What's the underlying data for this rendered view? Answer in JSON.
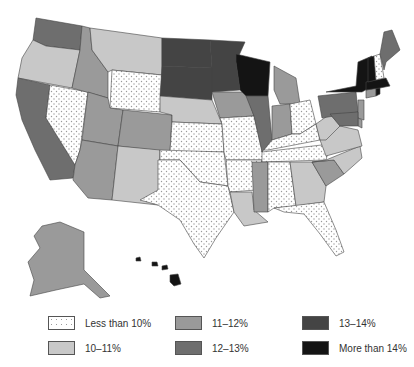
{
  "legend": {
    "items": [
      {
        "key": "lt10",
        "label": "Less than 10%",
        "fill": "dots"
      },
      {
        "key": "10_11",
        "label": "10–11%",
        "fill": "#c8c8c8"
      },
      {
        "key": "11_12",
        "label": "11–12%",
        "fill": "#9a9a9a"
      },
      {
        "key": "12_13",
        "label": "12–13%",
        "fill": "#6e6e6e"
      },
      {
        "key": "13_14",
        "label": "13–14%",
        "fill": "#444444"
      },
      {
        "key": "gt14",
        "label": "More than 14%",
        "fill": "#141414"
      }
    ]
  },
  "map_data": {
    "type": "choropleth",
    "region": "United States",
    "states": {
      "WA": "12_13",
      "OR": "10_11",
      "CA": "12_13",
      "NV": "lt10",
      "ID": "11_12",
      "MT": "10_11",
      "WY": "lt10",
      "UT": "11_12",
      "CO": "11_12",
      "AZ": "11_12",
      "NM": "10_11",
      "ND": "13_14",
      "SD": "13_14",
      "NE": "10_11",
      "KS": "lt10",
      "OK": "lt10",
      "TX": "lt10",
      "MN": "13_14",
      "IA": "11_12",
      "MO": "lt10",
      "AR": "lt10",
      "LA": "10_11",
      "WI": "gt14",
      "IL": "12_13",
      "MI": "11_12",
      "IN": "11_12",
      "OH": "lt10",
      "KY": "lt10",
      "TN": "lt10",
      "MS": "11_12",
      "AL": "lt10",
      "GA": "10_11",
      "FL": "lt10",
      "SC": "11_12",
      "NC": "10_11",
      "VA": "10_11",
      "WV": "10_11",
      "PA": "12_13",
      "NY": "gt14",
      "NJ": "11_12",
      "DE": "11_12",
      "MD": "12_13",
      "CT": "11_12",
      "RI": "gt14",
      "MA": "gt14",
      "VT": "gt14",
      "NH": "lt10",
      "ME": "12_13",
      "AK": "11_12",
      "HI": "gt14"
    }
  }
}
